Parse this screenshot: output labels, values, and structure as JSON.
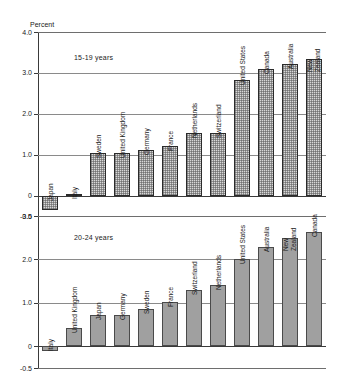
{
  "figure": {
    "axis_title": "Percent"
  },
  "chart_data": [
    {
      "type": "bar",
      "title": "15-19 years",
      "annotation": "15-19 years",
      "xlabel": "",
      "ylabel": "Percent",
      "ylim": [
        -0.5,
        4.0
      ],
      "yticks": [
        "4.0",
        "3.0",
        "2.0",
        "1.0",
        "0",
        "-0.5"
      ],
      "ytick_values": [
        4.0,
        3.0,
        2.0,
        1.0,
        0,
        -0.5
      ],
      "grid": true,
      "legend": "none",
      "categories": [
        "Japan",
        "Italy",
        "Sweden",
        "United Kingdom",
        "Germany",
        "France",
        "Netherlands",
        "Switzerland",
        "United States",
        "Canada",
        "Australia",
        "New Zealand"
      ],
      "values": [
        -0.35,
        0.05,
        1.03,
        1.03,
        1.12,
        1.22,
        1.52,
        1.52,
        2.82,
        3.1,
        3.22,
        3.33
      ]
    },
    {
      "type": "bar",
      "title": "20-24 years",
      "annotation": "20-24 years",
      "xlabel": "",
      "ylabel": "",
      "ylim": [
        -0.5,
        3.0
      ],
      "yticks": [
        "3.0",
        "2.0",
        "1.0",
        "0",
        "-0.5"
      ],
      "ytick_values": [
        3.0,
        2.0,
        1.0,
        0,
        -0.5
      ],
      "grid": true,
      "legend": "none",
      "categories": [
        "Italy",
        "United Kingdom",
        "Japan",
        "Germany",
        "Sweden",
        "France",
        "Switzerland",
        "Netherlands",
        "United States",
        "Australia",
        "New Zealand",
        "Canada"
      ],
      "values": [
        -0.12,
        0.42,
        0.72,
        0.72,
        0.85,
        1.02,
        1.3,
        1.42,
        2.0,
        2.28,
        2.5,
        2.63
      ]
    }
  ]
}
